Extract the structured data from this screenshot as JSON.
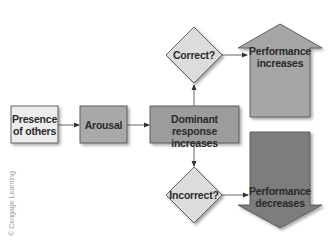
{
  "diagram": {
    "type": "flowchart",
    "nodes": {
      "presence": {
        "label_line1": "Presence",
        "label_line2": "of others",
        "shape": "rectangle",
        "fill": "#ececec"
      },
      "arousal": {
        "label": "Arousal",
        "shape": "rectangle",
        "fill": "#a9a9a9"
      },
      "dominant": {
        "label_line1": "Dominant response",
        "label_line2": "increases",
        "shape": "rectangle",
        "fill": "#9c9c9c"
      },
      "correct": {
        "label": "Correct?",
        "shape": "diamond",
        "fill": "#dcdcdc"
      },
      "incorrect": {
        "label": "Incorrect?",
        "shape": "diamond",
        "fill": "#dcdcdc"
      },
      "perf_up": {
        "label_line1": "Performance",
        "label_line2": "increases",
        "shape": "up-arrow",
        "fill": "#a6a6a6"
      },
      "perf_down": {
        "label_line1": "Performance",
        "label_line2": "decreases",
        "shape": "down-arrow",
        "fill": "#7d7d7d"
      }
    },
    "edges": [
      {
        "from": "presence",
        "to": "arousal"
      },
      {
        "from": "arousal",
        "to": "dominant"
      },
      {
        "from": "dominant",
        "to": "correct"
      },
      {
        "from": "dominant",
        "to": "incorrect"
      },
      {
        "from": "correct",
        "to": "perf_up"
      },
      {
        "from": "incorrect",
        "to": "perf_down"
      }
    ],
    "credit": "© Cengage Learning"
  }
}
